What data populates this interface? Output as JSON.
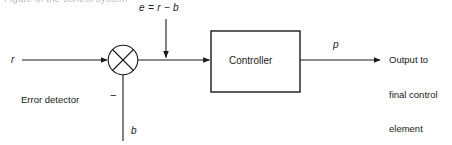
{
  "figure": {
    "type": "control-system-block-diagram",
    "background_color": "#ffffff",
    "line_color": "#1a1a1a",
    "text_color": "#1a1a1a"
  },
  "labels": {
    "reference_input": "r",
    "error_signal": "e = r − b",
    "controller_output": "p",
    "feedback_signal": "b",
    "negative_sign": "−",
    "controller_block": "Controller",
    "error_detector": "Error detector",
    "output_line_1": "Output to",
    "output_line_2": "final control",
    "output_line_3": "element"
  },
  "top_cropped_text": "Figure of the control system",
  "geometry": {
    "summing_junction": {
      "cx": 123,
      "cy": 60,
      "r": 15,
      "symbol": "circle-with-x"
    },
    "controller_box": {
      "x": 211,
      "y": 31,
      "width": 89,
      "height": 61
    },
    "main_line_y": 60,
    "input_arrow": {
      "x1": 22,
      "x2": 108
    },
    "junction_to_controller_arrow": {
      "x1": 138,
      "x2": 210
    },
    "error_arrow": {
      "x": 166,
      "y1": 19,
      "y2": 58
    },
    "feedback_line": {
      "x": 123,
      "y1": 75,
      "y2": 141
    },
    "output_arrow": {
      "x1": 300,
      "x2": 381,
      "y": 60
    }
  }
}
